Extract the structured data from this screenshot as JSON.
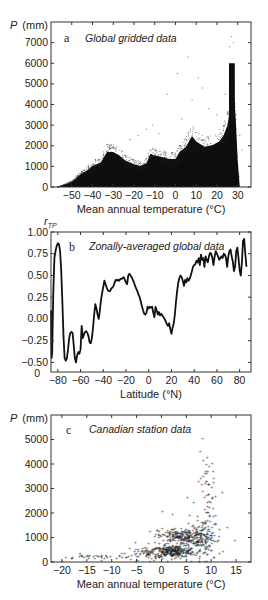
{
  "chart_data": [
    {
      "type": "scatter",
      "panel": "a",
      "title": "Global gridded data",
      "xlabel": "Mean annual temperature (°C)",
      "ylabel": "P (mm)",
      "xlim": [
        -60,
        36.4
      ],
      "ylim": [
        0,
        8000
      ],
      "xticks": [
        -50,
        -40,
        -30,
        -20,
        -10,
        0,
        10,
        20,
        30
      ],
      "yticks": [
        0,
        1000,
        2000,
        3000,
        4000,
        5000,
        6000,
        7000
      ],
      "grid": false,
      "envelope": {
        "x": [
          -57,
          -54,
          -50,
          -46,
          -42,
          -40,
          -36,
          -33,
          -30,
          -27,
          -24,
          -20,
          -17,
          -14,
          -12,
          -10,
          -6,
          -3,
          0,
          2,
          5,
          8,
          10,
          14,
          18,
          21,
          23,
          25,
          26,
          27,
          28,
          29,
          30,
          31
        ],
        "upper": [
          0,
          100,
          300,
          700,
          1000,
          1200,
          1400,
          2000,
          2000,
          1800,
          1500,
          1300,
          1200,
          1350,
          1900,
          1800,
          1700,
          1600,
          1600,
          2000,
          2300,
          2900,
          2600,
          2300,
          2400,
          2600,
          2900,
          3500,
          4200,
          6000,
          5500,
          4000,
          1500,
          0
        ]
      },
      "outliers": [
        {
          "x": 6,
          "y": 6300
        },
        {
          "x": 1,
          "y": 5500
        },
        {
          "x": 11,
          "y": 5300
        },
        {
          "x": 27,
          "y": 7300
        },
        {
          "x": 26,
          "y": 6800
        },
        {
          "x": 28,
          "y": 7000
        },
        {
          "x": 13,
          "y": 4800
        },
        {
          "x": -14,
          "y": 2800
        },
        {
          "x": -8,
          "y": 2600
        },
        {
          "x": -18,
          "y": 2500
        },
        {
          "x": -4,
          "y": 4500
        },
        {
          "x": 8,
          "y": 4200
        },
        {
          "x": 16,
          "y": 3800
        },
        {
          "x": 20,
          "y": 3500
        },
        {
          "x": 3,
          "y": 3300
        },
        {
          "x": 31,
          "y": 2500
        },
        {
          "x": 32,
          "y": 1800
        },
        {
          "x": -22,
          "y": 2300
        },
        {
          "x": -11,
          "y": 3000
        },
        {
          "x": 24,
          "y": 4500
        }
      ]
    },
    {
      "type": "line",
      "panel": "b",
      "title": "Zonally-averaged global data",
      "xlabel": "Latitude (°N)",
      "ylabel": "r_TP",
      "xlim": [
        -86,
        90
      ],
      "ylim": [
        -0.61,
        1.0
      ],
      "xticks": [
        -80,
        -60,
        -40,
        -20,
        0,
        20,
        40,
        60,
        80
      ],
      "yticks": [
        -0.5,
        -0.25,
        0.0,
        0.25,
        0.5,
        0.75,
        1.0
      ],
      "ytick_labels": [
        "−0.50",
        "−0.25",
        "0.00",
        "0.25",
        "0.50",
        "0.75",
        "1.00"
      ],
      "extra_ylabel": "0",
      "grid": false,
      "x": [
        -86,
        -85.5,
        -85,
        -84,
        -83,
        -82,
        -81,
        -80,
        -79,
        -78,
        -77,
        -76,
        -75,
        -74,
        -73,
        -72,
        -71,
        -70,
        -69,
        -68,
        -67,
        -66,
        -65,
        -64,
        -63,
        -62,
        -61,
        -60,
        -59,
        -58,
        -57,
        -56,
        -55,
        -54,
        -53,
        -52,
        -51,
        -50,
        -49,
        -48,
        -47,
        -46,
        -45,
        -44,
        -43,
        -42,
        -41,
        -40,
        -39,
        -38,
        -37,
        -36,
        -35,
        -34,
        -33,
        -32,
        -31,
        -30,
        -29,
        -28,
        -27,
        -26,
        -25,
        -24,
        -23,
        -22,
        -21,
        -20,
        -19,
        -18,
        -17,
        -16,
        -15,
        -14,
        -13,
        -12,
        -11,
        -10,
        -9,
        -8,
        -7,
        -6,
        -5,
        -4,
        -3,
        -2,
        -1,
        0,
        1,
        2,
        3,
        4,
        5,
        6,
        7,
        8,
        9,
        10,
        11,
        12,
        13,
        14,
        15,
        16,
        17,
        18,
        19,
        20,
        21,
        22,
        23,
        24,
        25,
        26,
        27,
        28,
        29,
        30,
        31,
        32,
        33,
        34,
        35,
        36,
        37,
        38,
        39,
        40,
        41,
        42,
        43,
        44,
        45,
        46,
        47,
        48,
        49,
        50,
        51,
        52,
        53,
        54,
        55,
        56,
        57,
        58,
        59,
        60,
        61,
        62,
        63,
        64,
        65,
        66,
        67,
        68,
        69,
        70,
        71,
        72,
        73,
        74,
        75,
        76,
        77,
        78,
        79,
        80,
        81,
        82,
        83,
        84,
        85,
        86,
        87,
        88,
        89,
        90
      ],
      "y": [
        0.1,
        -0.45,
        -0.4,
        0.3,
        0.7,
        0.78,
        0.84,
        0.87,
        0.86,
        0.78,
        0.55,
        0.2,
        -0.2,
        -0.45,
        -0.48,
        -0.45,
        -0.35,
        -0.22,
        -0.16,
        -0.15,
        -0.16,
        -0.3,
        -0.45,
        -0.5,
        -0.42,
        -0.38,
        -0.4,
        -0.35,
        -0.08,
        -0.22,
        -0.18,
        -0.15,
        -0.14,
        -0.16,
        -0.2,
        -0.27,
        -0.28,
        -0.22,
        -0.1,
        0.05,
        0.17,
        0.12,
        0.05,
        0.0,
        0.1,
        0.22,
        0.3,
        0.37,
        0.44,
        0.4,
        0.36,
        0.33,
        0.32,
        0.32,
        0.35,
        0.36,
        0.38,
        0.42,
        0.45,
        0.44,
        0.45,
        0.44,
        0.46,
        0.46,
        0.47,
        0.48,
        0.45,
        0.42,
        0.4,
        0.5,
        0.52,
        0.5,
        0.48,
        0.45,
        0.42,
        0.38,
        0.35,
        0.32,
        0.28,
        0.25,
        0.2,
        0.15,
        0.1,
        0.06,
        0.05,
        0.07,
        0.14,
        0.12,
        0.14,
        0.13,
        0.14,
        0.07,
        0.02,
        0.14,
        0.1,
        0.05,
        0.08,
        0.04,
        0.06,
        0.04,
        0.02,
        0.0,
        -0.03,
        -0.06,
        -0.08,
        -0.05,
        -0.12,
        -0.17,
        -0.1,
        -0.05,
        0.05,
        0.2,
        0.32,
        0.42,
        0.47,
        0.5,
        0.48,
        0.44,
        0.38,
        0.45,
        0.42,
        0.47,
        0.44,
        0.46,
        0.5,
        0.55,
        0.6,
        0.62,
        0.63,
        0.67,
        0.65,
        0.7,
        0.62,
        0.74,
        0.68,
        0.7,
        0.6,
        0.72,
        0.68,
        0.65,
        0.72,
        0.76,
        0.75,
        0.7,
        0.62,
        0.72,
        0.78,
        0.75,
        0.72,
        0.68,
        0.7,
        0.72,
        0.7,
        0.75,
        0.74,
        0.7,
        0.6,
        0.72,
        0.78,
        0.8,
        0.72,
        0.66,
        0.55,
        0.6,
        0.78,
        0.82,
        0.7,
        0.56,
        0.5,
        0.65,
        0.9,
        0.92,
        0.75,
        0.6
      ]
    },
    {
      "type": "scatter",
      "panel": "c",
      "title": "Canadian station data",
      "xlabel": "Mean annual temperature (°C)",
      "ylabel": "P (mm)",
      "xlim": [
        -22.2,
        18
      ],
      "ylim": [
        0,
        6000
      ],
      "xticks": [
        -20,
        -15,
        -10,
        -5,
        0,
        5,
        10,
        15
      ],
      "yticks": [
        0,
        1000,
        2000,
        3000,
        4000,
        5000
      ],
      "grid": false,
      "clusters": [
        {
          "cx": 2.5,
          "cy": 450,
          "sx": 2.2,
          "sy": 120,
          "n": 260
        },
        {
          "cx": 4.5,
          "cy": 1050,
          "sx": 2.6,
          "sy": 180,
          "n": 260
        },
        {
          "cx": 8.5,
          "cy": 900,
          "sx": 1.8,
          "sy": 450,
          "n": 90
        },
        {
          "cx": 9.5,
          "cy": 2300,
          "sx": 0.8,
          "sy": 900,
          "n": 60
        },
        {
          "cx": -2,
          "cy": 400,
          "sx": 2.5,
          "sy": 150,
          "n": 70
        },
        {
          "cx": -12,
          "cy": 220,
          "sx": 4,
          "sy": 60,
          "n": 40
        }
      ],
      "outliers": [
        {
          "x": 8.3,
          "y": 5050
        },
        {
          "x": 7.8,
          "y": 4550
        },
        {
          "x": 10.2,
          "y": 4050
        },
        {
          "x": 9.6,
          "y": 3900
        },
        {
          "x": 12.2,
          "y": 2850
        },
        {
          "x": 14.8,
          "y": 900
        },
        {
          "x": 5.2,
          "y": 2650
        },
        {
          "x": 0.2,
          "y": 2100
        },
        {
          "x": 2.2,
          "y": 1950
        },
        {
          "x": -5.2,
          "y": 800
        },
        {
          "x": -20,
          "y": 50
        },
        {
          "x": -18,
          "y": 150
        },
        {
          "x": 7.5,
          "y": 3300
        },
        {
          "x": 9,
          "y": 3300
        }
      ]
    }
  ],
  "panels": {
    "a": {
      "letter": "a",
      "title": "Global gridded data",
      "ylabel": "P (mm)",
      "xlabel": "Mean annual temperature (°C)"
    },
    "b": {
      "letter": "b",
      "title": "Zonally-averaged global data",
      "ylabel": "r",
      "ylabel_sub": "TP",
      "xlabel": "Latitude (°N)"
    },
    "c": {
      "letter": "c",
      "title": "Canadian station data",
      "ylabel": "P (mm)",
      "xlabel": "Mean annual temperature (°C)"
    }
  }
}
